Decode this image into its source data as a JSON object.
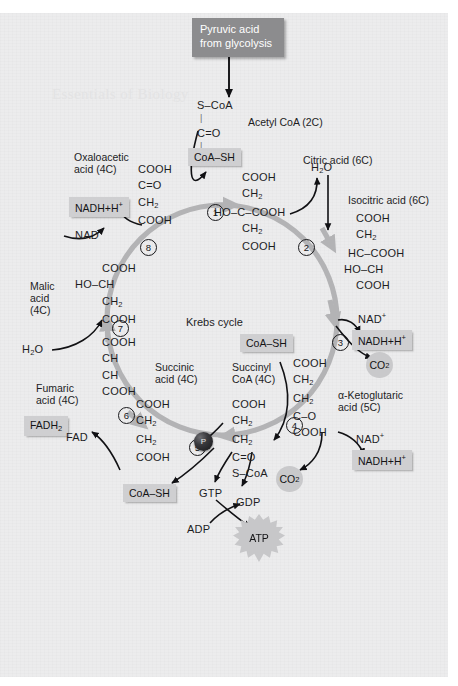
{
  "diagram": {
    "title": "Krebs cycle",
    "center_label": "Krebs cycle",
    "watermark": "Essentials of Biology",
    "colors": {
      "paper": "#ececed",
      "ring": "#b3b3b5",
      "chip": "#cfcfd1",
      "chip_dark": "#8c8c8e",
      "ink": "#1d1d1f",
      "blob": "#c9c9cb"
    }
  },
  "input": {
    "source_label": "Pyruvic acid\nfrom glycolysis",
    "source_line1": "Pyruvic acid",
    "source_line2": "from glycolysis",
    "acetyl_name": "Acetyl CoA (2C)",
    "acetyl_structure": [
      "S–CoA",
      "C=O",
      "CH",
      "3"
    ]
  },
  "metabolites": [
    {
      "id": "citric",
      "name": "Citric acid (6C)",
      "carbons": "6C",
      "structure": [
        "COOH",
        "CH2",
        "HO–C–COOH",
        "CH2",
        "COOH"
      ]
    },
    {
      "id": "isocitric",
      "name": "Isocitric acid (6C)",
      "carbons": "6C",
      "structure": [
        "COOH",
        "CH2",
        "HC–COOH",
        "HO–CH",
        "COOH"
      ]
    },
    {
      "id": "ketoglutaric",
      "name": "α-Ketoglutaric acid (5C)",
      "carbons": "5C",
      "name_line1": "α-Ketoglutaric",
      "name_line2": "acid (5C)",
      "structure": [
        "COOH",
        "CH2",
        "CH2",
        "C–O",
        "COOH"
      ]
    },
    {
      "id": "succinyl_coa",
      "name": "Succinyl CoA (4C)",
      "carbons": "4C",
      "name_line1": "Succinyl",
      "name_line2": "CoA (4C)",
      "structure": [
        "COOH",
        "CH2",
        "CH2",
        "C=O",
        "S–CoA"
      ]
    },
    {
      "id": "succinic",
      "name": "Succinic acid (4C)",
      "carbons": "4C",
      "name_line1": "Succinic",
      "name_line2": "acid (4C)",
      "structure": [
        "COOH",
        "CH2",
        "CH2",
        "COOH"
      ]
    },
    {
      "id": "fumaric",
      "name": "Fumaric acid (4C)",
      "carbons": "4C",
      "name_line1": "Fumaric",
      "name_line2": "acid (4C)",
      "structure": [
        "COOH",
        "CH",
        "CH",
        "COOH"
      ]
    },
    {
      "id": "malic",
      "name": "Malic acid (4C)",
      "carbons": "4C",
      "name_line1": "Malic",
      "name_line2": "acid",
      "name_line3": "(4C)",
      "structure": [
        "COOH",
        "HO–CH",
        "CH2",
        "COOH"
      ]
    },
    {
      "id": "oxaloacetic",
      "name": "Oxaloacetic acid (4C)",
      "carbons": "4C",
      "name_line1": "Oxaloacetic",
      "name_line2": "acid (4C)",
      "structure": [
        "COOH",
        "C=O",
        "CH2",
        "COOH"
      ]
    }
  ],
  "steps": [
    {
      "number": "1"
    },
    {
      "number": "2"
    },
    {
      "number": "3"
    },
    {
      "number": "4"
    },
    {
      "number": "5"
    },
    {
      "number": "6"
    },
    {
      "number": "7"
    },
    {
      "number": "8"
    }
  ],
  "chips": {
    "coa_sh_1": "CoA–SH",
    "coa_sh_4": "CoA–SH",
    "coa_sh_5": "CoA–SH",
    "nadh_8": "NADH+H",
    "nadh_3": "NADH+H",
    "nadh_4": "NADH+H",
    "fadh2": "FADH",
    "fadh2_sub": "2",
    "plus_sup": "+"
  },
  "cofactors": {
    "water_1": "H2O",
    "water_7": "H2O",
    "nad_plus_3": "NAD",
    "nad_plus_4": "NAD",
    "nad_8": "NAD",
    "fad": "FAD",
    "gtp": "GTP",
    "gdp": "GDP",
    "adp": "ADP",
    "atp": "ATP",
    "phosphate": "P",
    "co2_3": "CO",
    "co2_4": "CO",
    "co2_5": "CO",
    "co2_sub": "2",
    "h2o_sub": "2",
    "plus": "+"
  },
  "structures": {
    "citric": [
      "COOH",
      "CH",
      "HO–C–COOH",
      "CH",
      "COOH"
    ],
    "isocitric": [
      "COOH",
      "CH",
      "HC–COOH",
      "HO–CH",
      "COOH"
    ],
    "ketoglutaric": [
      "COOH",
      "CH",
      "CH",
      "C–O",
      "COOH"
    ],
    "succinyl": [
      "COOH",
      "CH",
      "CH",
      "C=O",
      "S–CoA"
    ],
    "succinic": [
      "COOH",
      "CH",
      "CH",
      "COOH"
    ],
    "fumaric": [
      "COOH",
      "CH",
      "CH",
      "COOH"
    ],
    "malic": [
      "COOH",
      "HO–CH",
      "CH",
      "COOH"
    ],
    "oxaloacetic": [
      "COOH",
      "C=O",
      "CH",
      "COOH"
    ],
    "acetyl": [
      "S–CoA",
      "C=O",
      "CH"
    ]
  }
}
